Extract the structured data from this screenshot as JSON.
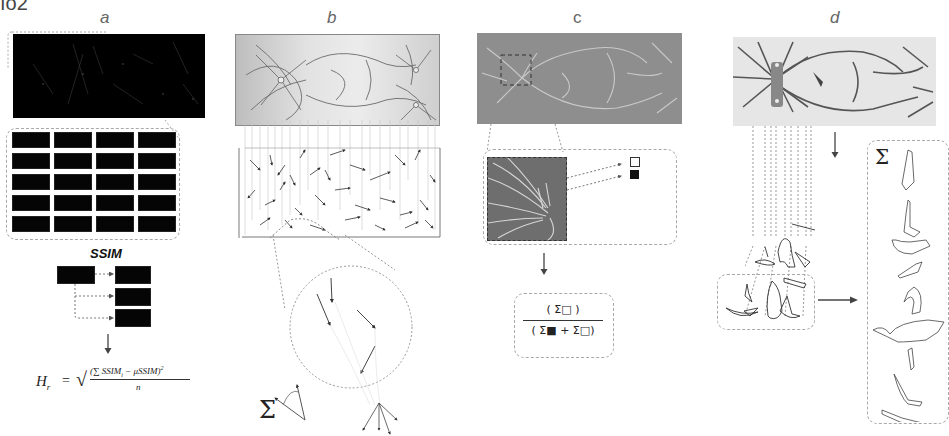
{
  "figure": {
    "corner_fragment": "ıo2",
    "panels": [
      {
        "id": "a",
        "label": "a"
      },
      {
        "id": "b",
        "label": "b"
      },
      {
        "id": "c",
        "label": "c"
      },
      {
        "id": "d",
        "label": "d"
      }
    ]
  },
  "panel_a": {
    "label": "a",
    "grid": {
      "rows": 5,
      "cols": 4
    },
    "ssim_title": "SSIM",
    "formula": {
      "lhs": "H",
      "lhs_sub": "r",
      "equals": "=",
      "sqrt": "√",
      "numerator": "(∑ SSIM",
      "numerator_sub": "i",
      "numerator_rest": " − μSSIM)",
      "numerator_sup": "2",
      "denominator": "n"
    }
  },
  "panel_b": {
    "label": "b",
    "sigma": "Σ"
  },
  "panel_c": {
    "label": "c",
    "legend": {
      "open_square": "□",
      "filled_square": "■"
    },
    "formula": {
      "numerator": "( Σ□ )",
      "denominator": "( Σ■ + Σ□)"
    }
  },
  "panel_d": {
    "label": "d",
    "sigma": "Σ"
  },
  "colors": {
    "background": "#ffffff",
    "dark_image": "#000000",
    "gray_micrograph": "#8e8e8e",
    "light_micrograph": "#e6e6e6",
    "dashed_border": "#a9a9a9",
    "arrow": "#444444"
  }
}
